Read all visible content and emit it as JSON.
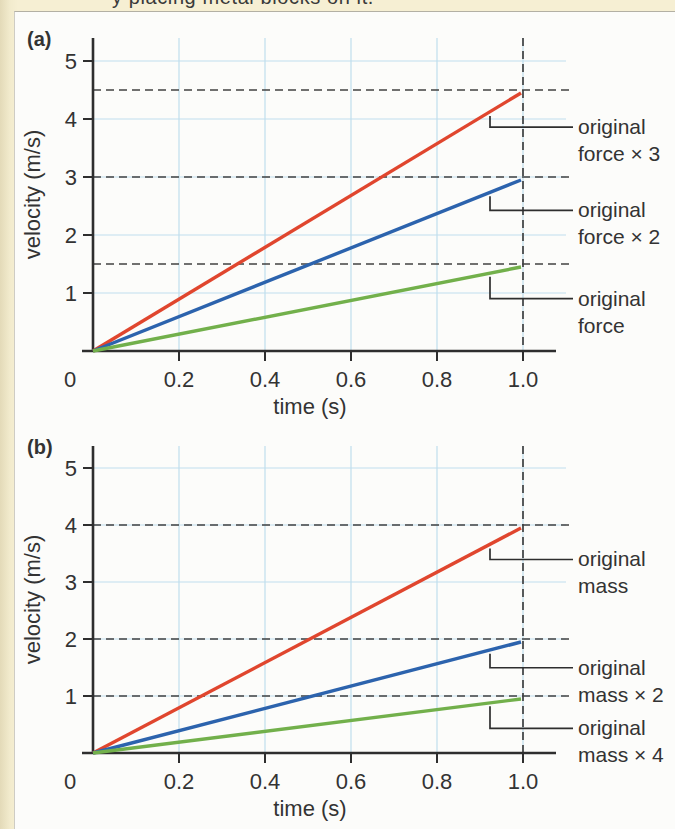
{
  "page": {
    "top_text_fragment": "y placing metal blocks on it.",
    "colors": {
      "page_background": "#f6efd3",
      "panel_background": "#fcfcfa",
      "axis": "#2e2e2e",
      "grid": "#bfdeed",
      "dashed_guide": "#414141",
      "text": "#333333"
    }
  },
  "chart_data": [
    {
      "type": "line",
      "panel_label": "(a)",
      "xlabel": "time (s)",
      "ylabel": "velocity (m/s)",
      "xlim": [
        0,
        1.08
      ],
      "ylim": [
        0,
        5.4
      ],
      "xtick_labels": [
        "0",
        "0.2",
        "0.4",
        "0.6",
        "0.8",
        "1.0"
      ],
      "xtick_values": [
        0,
        0.2,
        0.4,
        0.6,
        0.8,
        1.0
      ],
      "ytick_values": [
        1,
        2,
        3,
        4,
        5
      ],
      "grid": true,
      "legend_position": "right-callouts",
      "dashed_guides_y": [
        4.5,
        3.0,
        1.5
      ],
      "dashed_guide_x": 1.0,
      "series": [
        {
          "name": "original force × 3",
          "color": "#e0462e",
          "x": [
            0,
            1.0
          ],
          "y": [
            0,
            4.5
          ],
          "label_lines": [
            "original",
            "force × 3"
          ]
        },
        {
          "name": "original force × 2",
          "color": "#2c63ad",
          "x": [
            0,
            1.0
          ],
          "y": [
            0,
            3.0
          ],
          "label_lines": [
            "original",
            "force × 2"
          ]
        },
        {
          "name": "original force",
          "color": "#72b04b",
          "x": [
            0,
            1.0
          ],
          "y": [
            0,
            1.5
          ],
          "label_lines": [
            "original",
            "force"
          ]
        }
      ]
    },
    {
      "type": "line",
      "panel_label": "(b)",
      "xlabel": "time (s)",
      "ylabel": "velocity (m/s)",
      "xlim": [
        0,
        1.08
      ],
      "ylim": [
        0,
        5.4
      ],
      "xtick_labels": [
        "0",
        "0.2",
        "0.4",
        "0.6",
        "0.8",
        "1.0"
      ],
      "xtick_values": [
        0,
        0.2,
        0.4,
        0.6,
        0.8,
        1.0
      ],
      "ytick_values": [
        1,
        2,
        3,
        4,
        5
      ],
      "grid": true,
      "legend_position": "right-callouts",
      "dashed_guides_y": [
        4.0,
        2.0,
        1.0
      ],
      "dashed_guide_x": 1.0,
      "series": [
        {
          "name": "original mass",
          "color": "#e0462e",
          "x": [
            0,
            1.0
          ],
          "y": [
            0,
            4.0
          ],
          "label_lines": [
            "original",
            "mass"
          ]
        },
        {
          "name": "original mass × 2",
          "color": "#2c63ad",
          "x": [
            0,
            1.0
          ],
          "y": [
            0,
            2.0
          ],
          "label_lines": [
            "original",
            "mass × 2"
          ]
        },
        {
          "name": "original mass × 4",
          "color": "#72b04b",
          "x": [
            0,
            1.0
          ],
          "y": [
            0,
            1.0
          ],
          "label_lines": [
            "original",
            "mass × 4"
          ]
        }
      ]
    }
  ]
}
